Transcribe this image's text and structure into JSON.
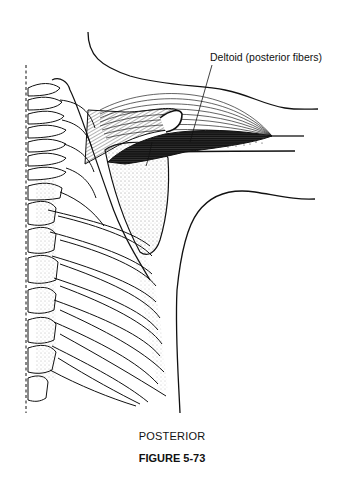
{
  "figure": {
    "annotation_label": "Deltoid (posterior fibers)",
    "view_label": "POSTERIOR",
    "caption": "FIGURE 5-73"
  },
  "colors": {
    "ink": "#111111",
    "background": "#ffffff"
  }
}
